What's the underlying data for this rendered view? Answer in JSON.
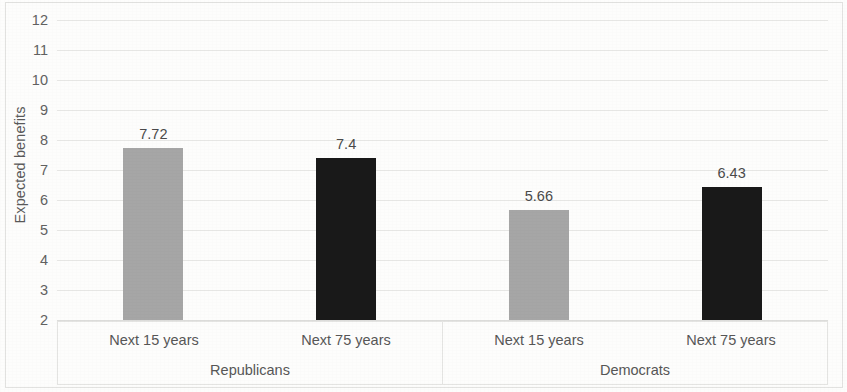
{
  "chart_data": {
    "type": "bar",
    "title": "",
    "xlabel": "",
    "ylabel": "Expected benefits",
    "ylim": [
      2,
      12
    ],
    "ytick_labels": [
      "12",
      "11",
      "10",
      "9",
      "8",
      "7",
      "6",
      "5",
      "4",
      "3",
      "2"
    ],
    "yticks": [
      12,
      11,
      10,
      9,
      8,
      7,
      6,
      5,
      4,
      3,
      2
    ],
    "grid": true,
    "legend": "none",
    "categories": [
      "Next 15 years",
      "Next 75 years"
    ],
    "groups": [
      "Republicans",
      "Democrats"
    ],
    "series": [
      {
        "name": "Next 15 years",
        "color": "#a6a6a6",
        "values": [
          7.72,
          5.66
        ]
      },
      {
        "name": "Next 75 years",
        "color": "#191919",
        "values": [
          7.4,
          6.43
        ]
      }
    ],
    "bars": [
      {
        "group": "Republicans",
        "category": "Next 15 years",
        "value": 7.72,
        "label": "7.72",
        "color": "#a6a6a6"
      },
      {
        "group": "Republicans",
        "category": "Next 75 years",
        "value": 7.4,
        "label": "7.4",
        "color": "#191919"
      },
      {
        "group": "Democrats",
        "category": "Next 15 years",
        "value": 5.66,
        "label": "5.66",
        "color": "#a6a6a6"
      },
      {
        "group": "Democrats",
        "category": "Next 75 years",
        "value": 6.43,
        "label": "6.43",
        "color": "#191919"
      }
    ]
  },
  "axis": {
    "y_title": "Expected benefits"
  },
  "colors": {
    "bar_gray": "#a6a6a6",
    "bar_black": "#191919",
    "gridline": "#e8e8e6",
    "text": "#575757",
    "background": "#fdfdfc"
  }
}
